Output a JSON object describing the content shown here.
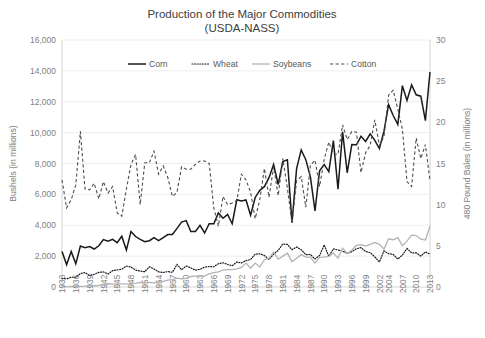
{
  "chart_data": {
    "type": "line",
    "title": "Production of the Major Commodities",
    "subtitle": "(USDA-NASS)",
    "xlabel": "",
    "ylabel": "Bushels (in millions)",
    "y2label": "480 Pound Bales (in millions)",
    "ylim": [
      0,
      16000
    ],
    "y2lim": [
      0,
      30
    ],
    "yticks": [
      "0",
      "2,000",
      "4,000",
      "6,000",
      "8,000",
      "10,000",
      "12,000",
      "14,000",
      "16,000"
    ],
    "y2ticks": [
      "0",
      "5",
      "10",
      "15",
      "20",
      "25",
      "30"
    ],
    "grid": true,
    "legend_position": "top-inside",
    "x": [
      1933,
      1934,
      1935,
      1936,
      1937,
      1938,
      1939,
      1940,
      1941,
      1942,
      1943,
      1944,
      1945,
      1946,
      1947,
      1948,
      1949,
      1950,
      1951,
      1952,
      1953,
      1954,
      1955,
      1956,
      1957,
      1958,
      1959,
      1960,
      1961,
      1962,
      1963,
      1964,
      1965,
      1966,
      1967,
      1968,
      1969,
      1970,
      1971,
      1972,
      1973,
      1974,
      1975,
      1976,
      1977,
      1978,
      1979,
      1980,
      1981,
      1982,
      1983,
      1984,
      1985,
      1986,
      1987,
      1988,
      1989,
      1990,
      1991,
      1992,
      1993,
      1994,
      1995,
      1996,
      1997,
      1998,
      1999,
      2000,
      2001,
      2002,
      2003,
      2004,
      2005,
      2006,
      2007,
      2008,
      2009,
      2010,
      2011,
      2012,
      2013
    ],
    "xticklabels": [
      "1933",
      "1936",
      "1939",
      "1942",
      "1945",
      "1948",
      "1951",
      "1954",
      "1957",
      "1960",
      "1963",
      "1966",
      "1969",
      "1972",
      "1975",
      "1978",
      "1981",
      "1984",
      "1987",
      "1990",
      "1993",
      "1996",
      "1999",
      "2002",
      "2004",
      "2007",
      "2010",
      "2013"
    ],
    "series": [
      {
        "name": "Corn",
        "axis": "left",
        "style": "solid",
        "color": "#1a1a1a",
        "units": "bushels (millions)",
        "values": [
          2300,
          1450,
          2300,
          1500,
          2650,
          2550,
          2620,
          2460,
          2670,
          3070,
          2970,
          3090,
          2870,
          3290,
          2400,
          3600,
          3270,
          3080,
          2930,
          3000,
          3200,
          3000,
          3200,
          3400,
          3400,
          3800,
          4200,
          4300,
          3600,
          3600,
          4000,
          3500,
          4100,
          4100,
          4800,
          4450,
          4700,
          4100,
          5650,
          5570,
          5640,
          4650,
          5800,
          6260,
          6500,
          7080,
          7940,
          6640,
          8120,
          8240,
          4170,
          7670,
          8880,
          8250,
          7130,
          4930,
          7530,
          7930,
          7470,
          9480,
          6340,
          10050,
          7400,
          9230,
          9210,
          9760,
          9430,
          9920,
          9500,
          8970,
          10090,
          11810,
          11110,
          10530,
          13040,
          12090,
          13090,
          12450,
          12360,
          10780,
          13930
        ]
      },
      {
        "name": "Wheat",
        "axis": "left",
        "style": "dotted",
        "color": "#1a1a1a",
        "units": "bushels (millions)",
        "values": [
          550,
          530,
          630,
          630,
          870,
          930,
          750,
          820,
          950,
          980,
          840,
          1060,
          1110,
          1150,
          1360,
          1290,
          1100,
          1030,
          990,
          1310,
          1170,
          980,
          940,
          1000,
          950,
          1460,
          1120,
          1360,
          1240,
          1090,
          1140,
          1290,
          1320,
          1310,
          1510,
          1570,
          1460,
          1370,
          1620,
          1550,
          1710,
          1780,
          2130,
          2150,
          2040,
          1780,
          2130,
          2370,
          2790,
          2760,
          2420,
          2590,
          2420,
          2090,
          2110,
          1810,
          2040,
          2730,
          1980,
          2470,
          2400,
          2320,
          2180,
          2280,
          2480,
          2550,
          2300,
          2230,
          1950,
          1620,
          2340,
          2160,
          2110,
          1810,
          2070,
          2500,
          2210,
          2210,
          2000,
          2270,
          2130
        ]
      },
      {
        "name": "Soybeans",
        "axis": "left",
        "style": "solid-gray",
        "color": "#b3b3b3",
        "units": "bushels (millions)",
        "values": [
          25,
          30,
          45,
          30,
          45,
          60,
          90,
          80,
          110,
          190,
          210,
          190,
          200,
          200,
          190,
          230,
          230,
          300,
          280,
          300,
          270,
          340,
          370,
          450,
          480,
          580,
          530,
          560,
          680,
          700,
          700,
          700,
          850,
          930,
          980,
          1100,
          1130,
          1130,
          1180,
          1270,
          1550,
          1220,
          1550,
          1290,
          1770,
          1870,
          2260,
          1800,
          2000,
          2190,
          1640,
          1860,
          2100,
          1940,
          1940,
          1550,
          1920,
          1930,
          1990,
          2200,
          1870,
          2520,
          2180,
          2380,
          2690,
          2740,
          2650,
          2760,
          2890,
          2760,
          2460,
          3120,
          3060,
          3200,
          2680,
          2970,
          3360,
          3330,
          3100,
          3040,
          3930
        ]
      },
      {
        "name": "Cotton",
        "axis": "right",
        "style": "dashed",
        "color": "#4d4d4d",
        "units": "480 pound bales (millions)",
        "values": [
          13.0,
          9.6,
          10.6,
          12.4,
          18.9,
          11.9,
          11.8,
          12.6,
          10.7,
          12.8,
          11.4,
          12.2,
          9.0,
          8.6,
          11.9,
          14.9,
          16.1,
          10.0,
          15.1,
          15.1,
          16.5,
          13.7,
          14.7,
          13.3,
          11.0,
          11.5,
          14.6,
          14.3,
          14.3,
          14.9,
          15.3,
          15.3,
          15.0,
          9.6,
          7.4,
          11.0,
          10.0,
          10.2,
          10.5,
          13.7,
          13.0,
          11.5,
          8.3,
          10.6,
          14.4,
          10.9,
          14.6,
          11.1,
          15.6,
          12.0,
          7.8,
          12.9,
          13.4,
          9.7,
          14.8,
          15.4,
          12.2,
          15.5,
          17.6,
          16.2,
          16.1,
          19.7,
          17.9,
          18.9,
          18.8,
          13.9,
          16.3,
          17.2,
          20.3,
          17.2,
          18.3,
          23.3,
          23.9,
          21.6,
          19.2,
          12.8,
          12.2,
          18.1,
          15.6,
          17.3,
          12.9
        ]
      }
    ]
  },
  "legend": {
    "items": [
      {
        "label": "Corn"
      },
      {
        "label": "Wheat"
      },
      {
        "label": "Soybeans"
      },
      {
        "label": "Cotton"
      }
    ]
  }
}
